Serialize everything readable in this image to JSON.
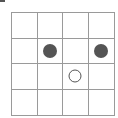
{
  "board": {
    "rows": 4,
    "cols": 4,
    "grid_color": "#9a9a9a",
    "piece_color": "#555555",
    "cells": [
      [
        "",
        "",
        "",
        ""
      ],
      [
        "",
        "filled",
        "",
        "filled"
      ],
      [
        "",
        "",
        "hollow",
        ""
      ],
      [
        "",
        "",
        "",
        ""
      ]
    ]
  }
}
